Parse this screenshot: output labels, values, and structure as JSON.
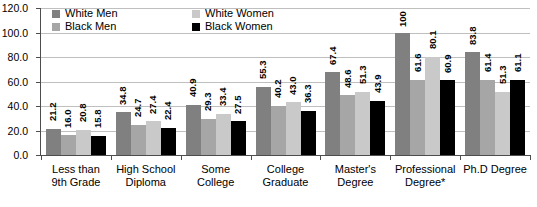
{
  "chart_data": {
    "type": "bar",
    "title": "",
    "xlabel": "",
    "ylabel": "",
    "ylim": [
      0,
      120
    ],
    "ytick_labels": [
      "120.0",
      "100.0",
      "80.0",
      "60.0",
      "40.0",
      "20.0",
      "0.0"
    ],
    "ytick_values": [
      120,
      100,
      80,
      60,
      40,
      20,
      0
    ],
    "grid": true,
    "legend_position": "top-left-inside",
    "categories": [
      "Less than 9th Grade",
      "High School Diploma",
      "Some College",
      "College Graduate",
      "Master's Degree",
      "Professional Degree*",
      "Ph.D Degree"
    ],
    "category_lines": [
      [
        "Less than",
        "9th Grade"
      ],
      [
        "High School",
        "Diploma"
      ],
      [
        "Some",
        "College"
      ],
      [
        "College",
        "Graduate"
      ],
      [
        "Master's",
        "Degree"
      ],
      [
        "Professional",
        "Degree*"
      ],
      [
        "Ph.D Degree",
        ""
      ]
    ],
    "series": [
      {
        "name": "White Men",
        "color": "#808080",
        "values": [
          21.2,
          34.8,
          40.9,
          55.3,
          67.4,
          100,
          83.8
        ],
        "labels": [
          "21.2",
          "34.8",
          "40.9",
          "55.3",
          "67.4",
          "100",
          "83.8"
        ]
      },
      {
        "name": "Black Men",
        "color": "#a6a6a6",
        "values": [
          16.0,
          24.7,
          29.3,
          40.2,
          48.6,
          61.6,
          61.4
        ],
        "labels": [
          "16.0",
          "24.7",
          "29.3",
          "40.2",
          "48.6",
          "61.6",
          "61.4"
        ]
      },
      {
        "name": "White Women",
        "color": "#c9c9c9",
        "values": [
          20.8,
          27.4,
          33.4,
          43.0,
          51.3,
          80.1,
          51.3
        ],
        "labels": [
          "20.8",
          "27.4",
          "33.4",
          "43.0",
          "51.3",
          "80.1",
          "51.3"
        ]
      },
      {
        "name": "Black Women",
        "color": "#000000",
        "values": [
          15.8,
          22.4,
          27.5,
          36.3,
          43.9,
          60.9,
          61.1
        ],
        "labels": [
          "15.8",
          "22.4",
          "27.5",
          "36.3",
          "43.9",
          "60.9",
          "61.1"
        ]
      }
    ],
    "legend_order": [
      "White Men",
      "White Women",
      "Black Men",
      "Black Women"
    ]
  }
}
